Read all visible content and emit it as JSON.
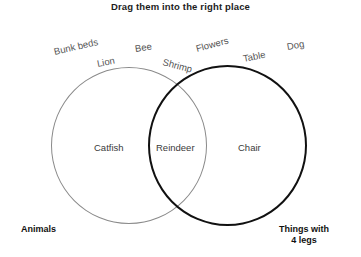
{
  "title": "Drag them into the right place",
  "tokens": [
    {
      "label": "Bunk beds",
      "x": 54,
      "y": 46,
      "rotate": -13
    },
    {
      "label": "Lion",
      "x": 97,
      "y": 58,
      "rotate": -11
    },
    {
      "label": "Bee",
      "x": 135,
      "y": 43,
      "rotate": -9
    },
    {
      "label": "Shrimp",
      "x": 163,
      "y": 56,
      "rotate": 15
    },
    {
      "label": "Flowers",
      "x": 196,
      "y": 43,
      "rotate": -15
    },
    {
      "label": "Table",
      "x": 243,
      "y": 53,
      "rotate": -11
    },
    {
      "label": "Dog",
      "x": 287,
      "y": 41,
      "rotate": -10
    }
  ],
  "venn": {
    "left_circle_color": "#8a8a8a",
    "right_circle_color": "#111111",
    "left_only_label": "Catfish",
    "overlap_label": "Reindeer",
    "right_only_label": "Chair",
    "left_caption": "Animals",
    "right_caption_line1": "Things with",
    "right_caption_line2": "4 legs"
  }
}
